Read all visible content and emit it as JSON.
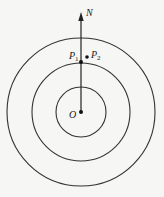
{
  "figure": {
    "background": "#f6f6f4",
    "stroke_color": "#333333",
    "center": {
      "x": 81,
      "y": 112
    },
    "circles": [
      {
        "name": "inner",
        "r": 25
      },
      {
        "name": "middle",
        "r": 49
      },
      {
        "name": "outer",
        "r": 74
      }
    ],
    "labels": {
      "north": "N",
      "origin": "O",
      "p1": "P",
      "p1_sub": "1",
      "p2": "P",
      "p2_sub": "2"
    }
  }
}
